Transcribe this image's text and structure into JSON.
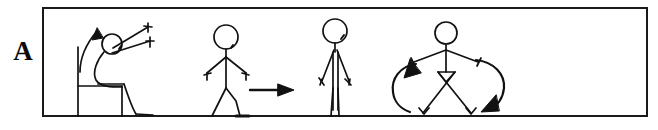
{
  "panel": {
    "label": "A",
    "title": "Sequence of movements: rise from chair, walk, stand, turn",
    "frame": {
      "border_color": "#1a1a1a",
      "fill_color": "#ffffff",
      "x": 42,
      "y": 7,
      "width": 606,
      "height": 110,
      "stroke_width": 2
    }
  },
  "style": {
    "ink_color": "#111111",
    "line_width": 1.6,
    "background": "#ffffff"
  },
  "figures": [
    {
      "id": "figure-rising-from-chair",
      "name": "rising-from-chair-figure",
      "order": 1,
      "action": "Rising from chair",
      "description": "Seated stick figure leaning forward on a chair with both arms extended forward and upward",
      "props": [
        "chair"
      ],
      "arrow": {
        "name": "upward-curved-arrow",
        "direction": "up",
        "shape": "curved",
        "meaning": "stand up"
      }
    },
    {
      "id": "figure-walking",
      "name": "walking-figure",
      "order": 2,
      "action": "Walking",
      "description": "Stick figure in mid-stride, side view, walking to the right",
      "props": [],
      "arrow": {
        "name": "rightward-straight-arrow",
        "direction": "right",
        "shape": "straight",
        "meaning": "walk forward"
      }
    },
    {
      "id": "figure-standing",
      "name": "standing-figure",
      "order": 3,
      "action": "Standing",
      "description": "Stick figure standing upright, facing forward, arms at sides, feet together",
      "props": [],
      "arrow": null
    },
    {
      "id": "figure-turning",
      "name": "turning-figure",
      "order": 4,
      "action": "Turning",
      "description": "Stick figure with arms spread downward and legs crossed mid-turn",
      "props": [],
      "arrow": {
        "name": "rotation-arrows-pair",
        "direction": "rotate",
        "shape": "two curved arrows",
        "meaning": "turn around"
      }
    }
  ]
}
